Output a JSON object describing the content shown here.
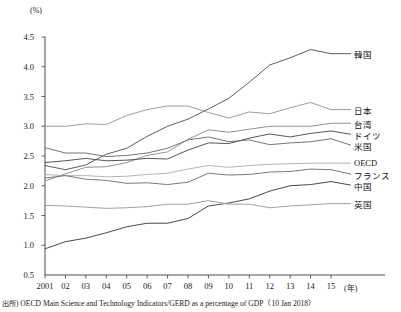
{
  "chart_data": {
    "type": "line",
    "title": "",
    "subtitle": "",
    "xlabel": "(年)",
    "ylabel": "(%)",
    "ylim": [
      0.5,
      4.5
    ],
    "ytick_values": [
      0.5,
      1.0,
      1.5,
      2.0,
      2.5,
      3.0,
      3.5,
      4.0,
      4.5
    ],
    "ytick_labels": [
      "0.5",
      "1.0",
      "1.5",
      "2.0",
      "2.5",
      "3.0",
      "3.5",
      "4.0",
      "4.5"
    ],
    "x": [
      2001,
      2002,
      2003,
      2004,
      2005,
      2006,
      2007,
      2008,
      2009,
      2010,
      2011,
      2012,
      2013,
      2014,
      2015
    ],
    "xtick_labels": [
      "2001",
      "02",
      "03",
      "04",
      "05",
      "06",
      "07",
      "08",
      "09",
      "10",
      "11",
      "12",
      "13",
      "14",
      "15"
    ],
    "grid": false,
    "legend_position": "right-inline",
    "series": [
      {
        "name": "韓国",
        "color": "#555555",
        "values": [
          2.34,
          2.27,
          2.35,
          2.53,
          2.63,
          2.83,
          3.0,
          3.12,
          3.29,
          3.47,
          3.74,
          4.03,
          4.15,
          4.29,
          4.22
        ]
      },
      {
        "name": "日本",
        "color": "#9a9a8c",
        "values": [
          3.0,
          3.0,
          3.04,
          3.03,
          3.18,
          3.28,
          3.34,
          3.34,
          3.23,
          3.14,
          3.24,
          3.21,
          3.31,
          3.4,
          3.28
        ]
      },
      {
        "name": "台湾",
        "color": "#8d8d7f",
        "values": [
          2.08,
          2.2,
          2.31,
          2.32,
          2.39,
          2.51,
          2.57,
          2.78,
          2.94,
          2.9,
          2.95,
          3.0,
          3.0,
          3.0,
          3.05
        ]
      },
      {
        "name": "ドイツ",
        "color": "#4d4d4d",
        "values": [
          2.39,
          2.42,
          2.46,
          2.42,
          2.43,
          2.46,
          2.45,
          2.6,
          2.72,
          2.71,
          2.8,
          2.87,
          2.82,
          2.88,
          2.92
        ]
      },
      {
        "name": "米国",
        "color": "#6f6f66",
        "values": [
          2.64,
          2.55,
          2.55,
          2.49,
          2.51,
          2.55,
          2.63,
          2.77,
          2.82,
          2.74,
          2.77,
          2.69,
          2.72,
          2.74,
          2.79
        ]
      },
      {
        "name": "OECD",
        "color": "#b0b0a8",
        "values": [
          2.19,
          2.17,
          2.17,
          2.15,
          2.16,
          2.19,
          2.21,
          2.28,
          2.34,
          2.31,
          2.34,
          2.36,
          2.37,
          2.38,
          2.38
        ]
      },
      {
        "name": "フランス",
        "color": "#747466",
        "values": [
          2.13,
          2.17,
          2.11,
          2.09,
          2.04,
          2.05,
          2.02,
          2.06,
          2.21,
          2.18,
          2.19,
          2.23,
          2.24,
          2.28,
          2.27
        ]
      },
      {
        "name": "中国",
        "color": "#3f3f3f",
        "values": [
          0.94,
          1.06,
          1.12,
          1.21,
          1.31,
          1.37,
          1.37,
          1.45,
          1.66,
          1.71,
          1.78,
          1.91,
          2.0,
          2.02,
          2.07
        ]
      },
      {
        "name": "英国",
        "color": "#9c9c94",
        "values": [
          1.67,
          1.66,
          1.64,
          1.62,
          1.63,
          1.65,
          1.69,
          1.69,
          1.75,
          1.69,
          1.69,
          1.63,
          1.66,
          1.68,
          1.7
        ]
      }
    ],
    "source_tag": "出所)",
    "source_text": "OECD Main Science and Technology Indicators/GERD as a percentage of GDP（10 Jan 2018）"
  }
}
